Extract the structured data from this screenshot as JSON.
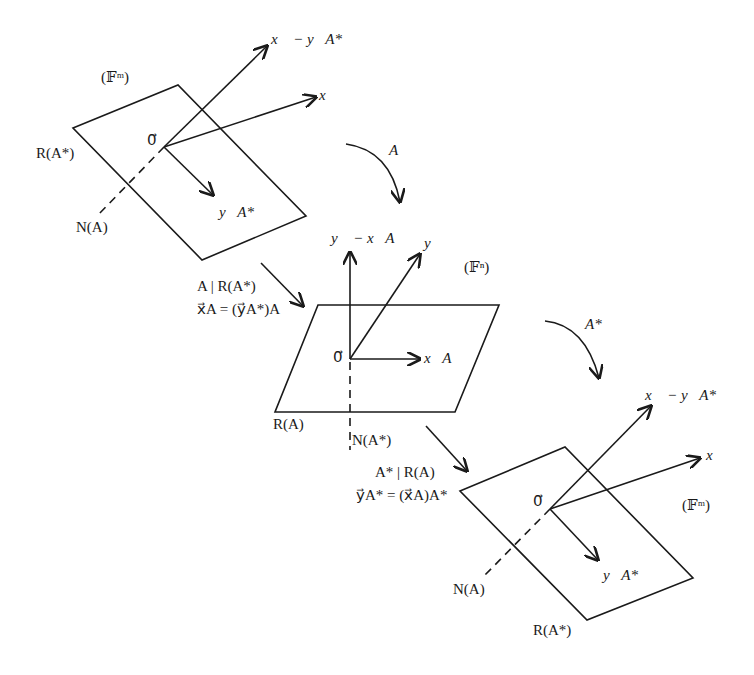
{
  "diagram": {
    "colors": {
      "ink": "#1a1a1a",
      "background": "#ffffff"
    },
    "spaces": {
      "top_left": {
        "space_label": "(𝔽ᵐ)",
        "plane_label": "R(A*)",
        "line_label": "N(A)",
        "origin_label": "0⃗",
        "vectors": {
          "x_minus_yAstar": "x⃗ − y⃗A*",
          "x": "x⃗",
          "yAstar": "y⃗A*"
        }
      },
      "middle": {
        "space_label": "(𝔽ⁿ)",
        "plane_label": "R(A)",
        "line_label": "N(A*)",
        "origin_label": "0⃗",
        "vectors": {
          "y_minus_xA": "y⃗ − x⃗A",
          "y": "y⃗",
          "xA": "x⃗A"
        }
      },
      "bottom_right": {
        "space_label": "(𝔽ᵐ)",
        "plane_label": "R(A*)",
        "line_label": "N(A)",
        "origin_label": "0⃗",
        "vectors": {
          "x_minus_yAstar": "x⃗ − y⃗A*",
          "x": "x⃗",
          "yAstar": "y⃗A*"
        }
      }
    },
    "maps": {
      "A": "A",
      "A_star": "A*",
      "restriction_1": "A | R(A*)",
      "equation_1": "x⃗A = (y⃗A*)A",
      "restriction_2": "A* | R(A)",
      "equation_2": "y⃗A* = (x⃗A)A*"
    }
  }
}
